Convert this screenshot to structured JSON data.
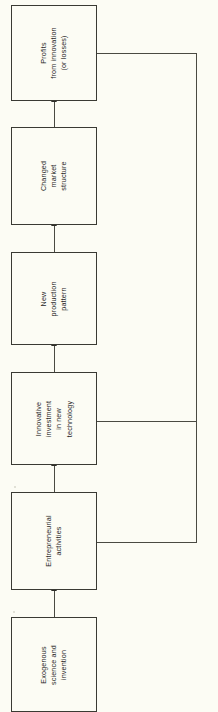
{
  "diagram": {
    "type": "flowchart",
    "orientation": "rotated-90-ccw",
    "background_color": "#fcfcf4",
    "line_color": "#4a4a42",
    "text_color": "#26261f",
    "nodes": [
      {
        "id": "profits",
        "lines": [
          "Profits",
          "from innovation",
          "(or losses)"
        ],
        "line1": "Profits",
        "line2": "from innovation",
        "line3": "(or losses)"
      },
      {
        "id": "market-structure",
        "lines": [
          "Changed",
          "market",
          "structure"
        ],
        "line1": "Changed",
        "line2": "market",
        "line3": "structure"
      },
      {
        "id": "production-pattern",
        "lines": [
          "New",
          "production",
          "pattern"
        ],
        "line1": "New",
        "line2": "production",
        "line3": "pattern"
      },
      {
        "id": "innovative-investment",
        "lines": [
          "Innovative",
          "investment",
          "in new",
          "technology"
        ],
        "line1": "Innovative",
        "line2": "investment",
        "line3": "in new",
        "line4": "technology"
      },
      {
        "id": "entrepreneurial-activities",
        "lines": [
          "Entrepreneurial",
          "activities"
        ],
        "line1": "Entrepreneurial",
        "line2": "activities"
      },
      {
        "id": "exogenous-science",
        "lines": [
          "Exogenous",
          "science and",
          "invention"
        ],
        "line1": "Exogenous",
        "line2": "science and",
        "line3": "invention"
      }
    ],
    "connections": [
      {
        "id": "exogenous-to-entrepreneurial",
        "from": "exogenous-science",
        "to": "entrepreneurial-activities",
        "kind": "forward"
      },
      {
        "id": "entrepreneurial-to-investment",
        "from": "entrepreneurial-activities",
        "to": "innovative-investment",
        "kind": "forward"
      },
      {
        "id": "investment-to-production",
        "from": "innovative-investment",
        "to": "production-pattern",
        "kind": "forward"
      },
      {
        "id": "production-to-market",
        "from": "production-pattern",
        "to": "market-structure",
        "kind": "forward"
      },
      {
        "id": "market-to-profits",
        "from": "market-structure",
        "to": "profits",
        "kind": "forward"
      },
      {
        "id": "profits-feedback-to-investment",
        "from": "profits",
        "to": "innovative-investment",
        "kind": "feedback"
      },
      {
        "id": "profits-feedback-to-entrepreneurial",
        "from": "profits",
        "to": "entrepreneurial-activities",
        "kind": "feedback"
      }
    ]
  }
}
